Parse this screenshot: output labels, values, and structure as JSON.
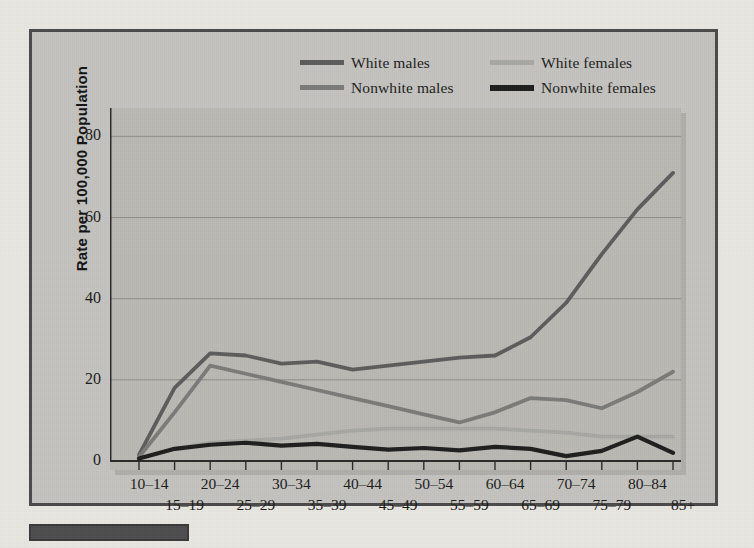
{
  "figure": {
    "background_color": "#c3c2be",
    "panel_color": "#b9b8b3",
    "frame_color": "#4a4a4a"
  },
  "legend": {
    "position": "top-center",
    "entries": [
      {
        "label": "White males",
        "color": "#5c5c5c",
        "swatch": "line-swatch"
      },
      {
        "label": "White females",
        "color": "#a7a7a3",
        "swatch": "line-swatch"
      },
      {
        "label": "Nonwhite males",
        "color": "#7a7a78",
        "swatch": "line-swatch"
      },
      {
        "label": "Nonwhite females",
        "color": "#1e1e1e",
        "swatch": "line-swatch"
      }
    ]
  },
  "axes": {
    "y_title": "Rate per 100,000 Population",
    "y_ticks": [
      "0",
      "20",
      "40",
      "60",
      "80"
    ],
    "y_tick_values": [
      0,
      20,
      40,
      60,
      80
    ],
    "ylim": [
      0,
      87
    ],
    "x_ticks_top": [
      "10–14",
      "20–24",
      "30–34",
      "40–44",
      "50–54",
      "60–64",
      "70–74",
      "80–84"
    ],
    "x_ticks_bottom": [
      "15–19",
      "25–29",
      "35–39",
      "45–49",
      "55–59",
      "65–69",
      "75–79",
      "85+"
    ],
    "grid": true
  },
  "chart_data": {
    "type": "line",
    "title": "",
    "xlabel": "",
    "ylabel": "Rate per 100,000 Population",
    "ylim": [
      0,
      87
    ],
    "grid": true,
    "legend_position": "top-center",
    "categories": [
      "10–14",
      "15–19",
      "20–24",
      "25–29",
      "30–34",
      "35–39",
      "40–44",
      "45–49",
      "50–54",
      "55–59",
      "60–64",
      "65–69",
      "70–74",
      "75–79",
      "80–84",
      "85+"
    ],
    "series": [
      {
        "name": "White males",
        "color": "#5c5c5c",
        "values": [
          1.5,
          18.0,
          26.5,
          26.0,
          24.0,
          24.5,
          22.5,
          23.5,
          24.5,
          25.5,
          26.0,
          30.5,
          39.0,
          51.0,
          62.0,
          71.0
        ]
      },
      {
        "name": "White females",
        "color": "#a7a7a3",
        "values": [
          0.8,
          3.0,
          4.5,
          5.0,
          5.5,
          6.5,
          7.5,
          8.0,
          8.0,
          8.0,
          8.0,
          7.5,
          7.0,
          6.0,
          6.0,
          6.0
        ]
      },
      {
        "name": "Nonwhite males",
        "color": "#7a7a78",
        "values": [
          1.0,
          12.0,
          23.5,
          21.5,
          19.5,
          17.5,
          15.5,
          13.5,
          11.5,
          9.5,
          12.0,
          15.5,
          15.0,
          13.0,
          17.0,
          22.0
        ]
      },
      {
        "name": "Nonwhite females",
        "color": "#1e1e1e",
        "values": [
          0.6,
          3.0,
          4.0,
          4.5,
          3.8,
          4.2,
          3.5,
          2.8,
          3.2,
          2.6,
          3.5,
          3.0,
          1.2,
          2.5,
          6.0,
          2.0
        ]
      }
    ]
  }
}
